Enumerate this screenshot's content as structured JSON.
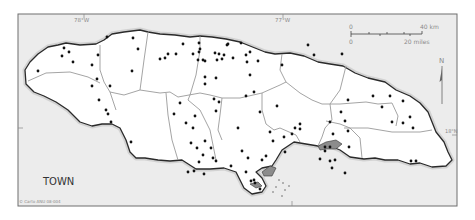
{
  "map": {
    "title": "TOWN",
    "credit": "© Carto ANU 08-004",
    "graticule": {
      "lon_labels": [
        {
          "text": "78°W",
          "x": 82
        },
        {
          "text": "77°W",
          "x": 278
        }
      ],
      "lat_labels": [
        {
          "text": "18°N",
          "y": 133
        }
      ]
    },
    "scale_bar": {
      "km_start": "0",
      "km_end": "40 km",
      "mi_start": "0",
      "mi_end": "20 miles"
    },
    "north_arrow": {
      "label": "N"
    },
    "colors": {
      "sea": "#ececec",
      "land": "#ffffff",
      "coast": "#2a2a2a",
      "parish_boundary": "#9a9a9a",
      "town_dot": "#111111"
    },
    "towns": [
      [
        64,
        48
      ],
      [
        69,
        52
      ],
      [
        62,
        56
      ],
      [
        73,
        62
      ],
      [
        38,
        71
      ],
      [
        92,
        65
      ],
      [
        98,
        55
      ],
      [
        97,
        79
      ],
      [
        110,
        86
      ],
      [
        107,
        37
      ],
      [
        133,
        38
      ],
      [
        138,
        49
      ],
      [
        132,
        71
      ],
      [
        160,
        59
      ],
      [
        165,
        58
      ],
      [
        183,
        44
      ],
      [
        193,
        54
      ],
      [
        199,
        52
      ],
      [
        168,
        54
      ],
      [
        176,
        54
      ],
      [
        199,
        43
      ],
      [
        200,
        49
      ],
      [
        203,
        60
      ],
      [
        198,
        60
      ],
      [
        205,
        61
      ],
      [
        215,
        53
      ],
      [
        224,
        55
      ],
      [
        227,
        45
      ],
      [
        228,
        44
      ],
      [
        219,
        54
      ],
      [
        217,
        60
      ],
      [
        246,
        55
      ],
      [
        250,
        52
      ],
      [
        258,
        61
      ],
      [
        250,
        75
      ],
      [
        254,
        92
      ],
      [
        247,
        62
      ],
      [
        241,
        43
      ],
      [
        233,
        58
      ],
      [
        216,
        78
      ],
      [
        222,
        59
      ],
      [
        205,
        77
      ],
      [
        205,
        84
      ],
      [
        246,
        96
      ],
      [
        282,
        65
      ],
      [
        308,
        45
      ],
      [
        314,
        55
      ],
      [
        342,
        54
      ],
      [
        373,
        96
      ],
      [
        348,
        100
      ],
      [
        390,
        96
      ],
      [
        403,
        101
      ],
      [
        410,
        117
      ],
      [
        413,
        128
      ],
      [
        403,
        123
      ],
      [
        341,
        112
      ],
      [
        330,
        122
      ],
      [
        345,
        121
      ],
      [
        348,
        131
      ],
      [
        333,
        134
      ],
      [
        382,
        107
      ],
      [
        392,
        122
      ],
      [
        411,
        161
      ],
      [
        416,
        161
      ],
      [
        300,
        129
      ],
      [
        295,
        128
      ],
      [
        300,
        124
      ],
      [
        277,
        106
      ],
      [
        260,
        112
      ],
      [
        292,
        134
      ],
      [
        108,
        114
      ],
      [
        111,
        122
      ],
      [
        131,
        142
      ],
      [
        180,
        103
      ],
      [
        174,
        114
      ],
      [
        186,
        123
      ],
      [
        193,
        128
      ],
      [
        195,
        116
      ],
      [
        205,
        141
      ],
      [
        191,
        143
      ],
      [
        197,
        148
      ],
      [
        199,
        162
      ],
      [
        194,
        171
      ],
      [
        188,
        172
      ],
      [
        203,
        155
      ],
      [
        213,
        158
      ],
      [
        211,
        148
      ],
      [
        231,
        166
      ],
      [
        204,
        174
      ],
      [
        216,
        161
      ],
      [
        216,
        111
      ],
      [
        214,
        99
      ],
      [
        219,
        102
      ],
      [
        106,
        110
      ],
      [
        92,
        86
      ],
      [
        99,
        100
      ],
      [
        262,
        160
      ],
      [
        266,
        156
      ],
      [
        248,
        158
      ],
      [
        246,
        172
      ],
      [
        251,
        181
      ],
      [
        254,
        180
      ],
      [
        255,
        183
      ],
      [
        260,
        189
      ],
      [
        242,
        151
      ],
      [
        238,
        128
      ],
      [
        284,
        137
      ],
      [
        270,
        132
      ],
      [
        273,
        141
      ],
      [
        285,
        152
      ],
      [
        325,
        147
      ],
      [
        320,
        159
      ],
      [
        325,
        151
      ],
      [
        330,
        161
      ],
      [
        335,
        160
      ],
      [
        330,
        147
      ],
      [
        349,
        147
      ],
      [
        332,
        168
      ],
      [
        345,
        173
      ]
    ]
  }
}
